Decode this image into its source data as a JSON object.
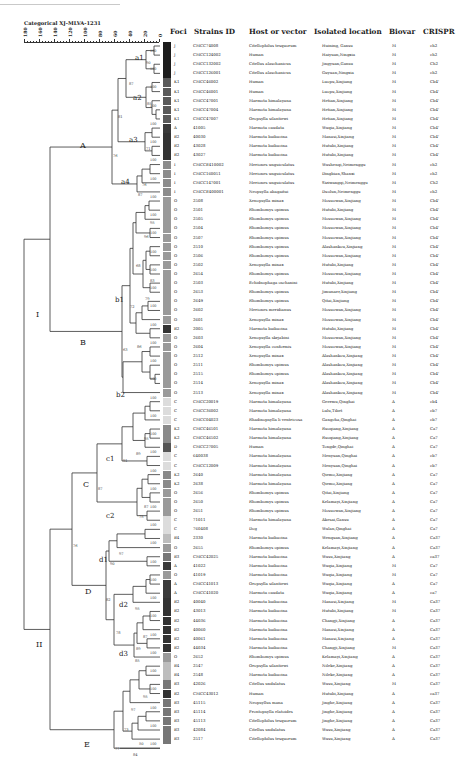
{
  "scale": {
    "title": "Categorical XJ-MLVA-1231",
    "ticks": [
      "180",
      "160",
      "140",
      "120",
      "100",
      "80",
      "60",
      "40",
      "20",
      "0"
    ]
  },
  "headers": {
    "foci": "Foci",
    "strain": "Strains ID",
    "host": "Host or vector",
    "location": "Isolated location",
    "biovar": "Biovar",
    "crispr": "CRISPR"
  },
  "foci_colors": {
    "J": "#1c1c1c",
    "K1": "#5a5a5a",
    "A": "#3a3a3a",
    "B2": "#333333",
    "I": "#8c8c8c",
    "O": "#9a9a9a",
    "C": "#dcdcdc",
    "K2": "#8a8a8a",
    "D": "#555555",
    "B4": "#bdbdbd",
    "B3": "#777777"
  },
  "clades": [
    {
      "label": "I",
      "x": 36,
      "y": 317
    },
    {
      "label": "II",
      "x": 36,
      "y": 647
    },
    {
      "label": "A",
      "x": 80,
      "y": 148
    },
    {
      "label": "B",
      "x": 80,
      "y": 345
    },
    {
      "label": "C",
      "x": 83,
      "y": 487
    },
    {
      "label": "D",
      "x": 85,
      "y": 594
    },
    {
      "label": "E",
      "x": 84,
      "y": 747
    },
    {
      "label": "a1",
      "x": 135,
      "y": 60
    },
    {
      "label": "a2",
      "x": 133,
      "y": 100
    },
    {
      "label": "a3",
      "x": 129,
      "y": 142
    },
    {
      "label": "a4",
      "x": 121,
      "y": 184
    },
    {
      "label": "b1",
      "x": 115,
      "y": 302
    },
    {
      "label": "b2",
      "x": 116,
      "y": 397
    },
    {
      "label": "c1",
      "x": 106,
      "y": 461
    },
    {
      "label": "c2",
      "x": 106,
      "y": 518
    },
    {
      "label": "d1",
      "x": 99,
      "y": 562
    },
    {
      "label": "d2",
      "x": 119,
      "y": 607
    },
    {
      "label": "d3",
      "x": 119,
      "y": 656
    }
  ],
  "bootstrap": [
    {
      "v": "90",
      "x": 146,
      "y": 64
    },
    {
      "v": "87",
      "x": 129,
      "y": 85
    },
    {
      "v": "85",
      "x": 147,
      "y": 105
    },
    {
      "v": "81",
      "x": 118,
      "y": 118
    },
    {
      "v": "71",
      "x": 146,
      "y": 150
    },
    {
      "v": "76",
      "x": 113,
      "y": 157
    },
    {
      "v": "76",
      "x": 142,
      "y": 186
    },
    {
      "v": "87",
      "x": 138,
      "y": 196
    },
    {
      "v": "95",
      "x": 150,
      "y": 224
    },
    {
      "v": "96",
      "x": 144,
      "y": 238
    },
    {
      "v": "68",
      "x": 136,
      "y": 267
    },
    {
      "v": "83",
      "x": 150,
      "y": 282
    },
    {
      "v": "79",
      "x": 145,
      "y": 300
    },
    {
      "v": "72",
      "x": 130,
      "y": 308
    },
    {
      "v": "86",
      "x": 137,
      "y": 348
    },
    {
      "v": "63",
      "x": 123,
      "y": 351
    },
    {
      "v": "95",
      "x": 144,
      "y": 440
    },
    {
      "v": "89",
      "x": 136,
      "y": 455
    },
    {
      "v": "91",
      "x": 123,
      "y": 462
    },
    {
      "v": "87",
      "x": 98,
      "y": 490
    },
    {
      "v": "87",
      "x": 144,
      "y": 508
    },
    {
      "v": "75",
      "x": 139,
      "y": 518
    },
    {
      "v": "76",
      "x": 73,
      "y": 547
    },
    {
      "v": "97",
      "x": 119,
      "y": 555
    },
    {
      "v": "90",
      "x": 110,
      "y": 565
    },
    {
      "v": "82",
      "x": 106,
      "y": 601
    },
    {
      "v": "95",
      "x": 135,
      "y": 610
    },
    {
      "v": "78",
      "x": 116,
      "y": 634
    },
    {
      "v": "87",
      "x": 143,
      "y": 638
    },
    {
      "v": "89",
      "x": 136,
      "y": 650
    },
    {
      "v": "85",
      "x": 135,
      "y": 662
    },
    {
      "v": "95",
      "x": 143,
      "y": 698
    },
    {
      "v": "97",
      "x": 131,
      "y": 711
    },
    {
      "v": "73",
      "x": 124,
      "y": 731
    },
    {
      "v": "50",
      "x": 139,
      "y": 745
    },
    {
      "v": "77",
      "x": 115,
      "y": 750
    },
    {
      "v": "84",
      "x": 133,
      "y": 756
    }
  ],
  "rows": [
    {
      "foci": "J",
      "id": "CMCC74008",
      "host": "Citellophilus tesquorum",
      "loc": "Huining, Gansu",
      "bio": "M",
      "crispr": "ch2"
    },
    {
      "foci": "J",
      "id": "CMCC124002",
      "host": "Human",
      "loc": "Haiyuan,Ningxia",
      "bio": "M",
      "crispr": "ch2"
    },
    {
      "foci": "J",
      "id": "CMCC132002",
      "host": "Citellus alaschanicus",
      "loc": "Jingyuan,Gansu",
      "bio": "M",
      "crispr": "Ch2"
    },
    {
      "foci": "J",
      "id": "CMCC126001",
      "host": "Citellus alaschanicus",
      "loc": "Guyuan,Ningxia",
      "bio": "M",
      "crispr": "ch2"
    },
    {
      "foci": "K1",
      "id": "CMCC46002",
      "host": "Human",
      "loc": "Luopu,Xinjiang",
      "bio": "M",
      "crispr": "Cb4'"
    },
    {
      "foci": "K1",
      "id": "CMCC46001",
      "host": "Human",
      "loc": "Luopu,Xinjiang",
      "bio": "M",
      "crispr": "Cb4'"
    },
    {
      "foci": "K1",
      "id": "CMCC47001",
      "host": "Marmota himalayana",
      "loc": "Hetian,Xinjiang",
      "bio": "M",
      "crispr": "Cb4'"
    },
    {
      "foci": "K1",
      "id": "CMCC47004",
      "host": "Marmota himalayana",
      "loc": "Hetian,Xinjiang",
      "bio": "M",
      "crispr": "Cb4'"
    },
    {
      "foci": "K1",
      "id": "CMCC47007",
      "host": "Oropsylla silantiewi",
      "loc": "Hetian,Xinjiang",
      "bio": "M",
      "crispr": "Cb4'"
    },
    {
      "foci": "A",
      "id": "41005",
      "host": "Marmota caudata",
      "loc": "Wuqia,Xinjiang",
      "bio": "M",
      "crispr": "Cb4'"
    },
    {
      "foci": "B2",
      "id": "40030",
      "host": "Marmota baibacina",
      "loc": "Manasi,Xinjiang",
      "bio": "M",
      "crispr": "Cb4'"
    },
    {
      "foci": "B2",
      "id": "43028",
      "host": "Marmota baibacina",
      "loc": "Hutubi,Xinjiang",
      "bio": "M",
      "crispr": "Cb4'"
    },
    {
      "foci": "B2",
      "id": "43027",
      "host": "Marmota baibacina",
      "loc": "Hutubi,Xinjiang",
      "bio": "M",
      "crispr": "Cb4'"
    },
    {
      "foci": "I",
      "id": "CMCCE410002",
      "host": "Meriones unguiculatus",
      "loc": "Wushenqi,Neimenggu",
      "bio": "M",
      "crispr": "ch2"
    },
    {
      "foci": "I",
      "id": "CMCC160051",
      "host": "Meriones unguiculatus",
      "loc": "Dingbian,Shanxi",
      "bio": "M",
      "crispr": "ch2"
    },
    {
      "foci": "I",
      "id": "CMCC147001",
      "host": "Meriones unguiculatus",
      "loc": "Siziwangqi,Neimenggu",
      "bio": "M",
      "crispr": "Ch2"
    },
    {
      "foci": "I",
      "id": "CMCCE400001",
      "host": "Neopsylla abagaitui",
      "loc": "Duolun,Neimenggu",
      "bio": "M",
      "crispr": "ch2"
    },
    {
      "foci": "O",
      "id": "2508",
      "host": "Xenopsylla minax",
      "loc": "Mosuowan,Xinjiang",
      "bio": "M",
      "crispr": "Cb4'"
    },
    {
      "foci": "O",
      "id": "2501",
      "host": "Rhombomys opimus",
      "loc": "Hutubi,Xinjiang",
      "bio": "M",
      "crispr": "Cb4'"
    },
    {
      "foci": "O",
      "id": "2505",
      "host": "Rhombomys opimus",
      "loc": "Mosuowan,Xinjiang",
      "bio": "M",
      "crispr": "Cb4'"
    },
    {
      "foci": "O",
      "id": "2504",
      "host": "Rhombomys opimus",
      "loc": "Mosuowan,Xinjiang",
      "bio": "M",
      "crispr": "Cb4'"
    },
    {
      "foci": "O",
      "id": "2507",
      "host": "Rhombomys opimus",
      "loc": "Mosuowan,Xinjiang",
      "bio": "M",
      "crispr": "Cb4'"
    },
    {
      "foci": "O",
      "id": "2510",
      "host": "Rhombomys opimus",
      "loc": "Alashankou,Xinjiang",
      "bio": "M",
      "crispr": "Cb4'"
    },
    {
      "foci": "O",
      "id": "2506",
      "host": "Rhombomys opimus",
      "loc": "Mosuowan,Xinjiang",
      "bio": "M",
      "crispr": "Cb4'"
    },
    {
      "foci": "O",
      "id": "2502",
      "host": "Xenopsylla minax",
      "loc": "Hutubi,Xinjiang",
      "bio": "M",
      "crispr": "Cb4'"
    },
    {
      "foci": "O",
      "id": "2654",
      "host": "Rhombomys opimus",
      "loc": "Mosuowan,Xinjiang",
      "bio": "M",
      "crispr": "Cb4'"
    },
    {
      "foci": "O",
      "id": "2503",
      "host": "Echidnophaga oschanini",
      "loc": "Hutubi,Xinjiang",
      "bio": "M",
      "crispr": "Cb4'"
    },
    {
      "foci": "O",
      "id": "2653",
      "host": "Rhombomys opimus",
      "loc": "Jimunaer,Xinjiang",
      "bio": "M",
      "crispr": "Cb4'"
    },
    {
      "foci": "O",
      "id": "2649",
      "host": "Rhombomys opimus",
      "loc": "Qitai,Xinjiang",
      "bio": "M",
      "crispr": "Cb4'"
    },
    {
      "foci": "O",
      "id": "2602",
      "host": "Meriones meridianus",
      "loc": "Mosuowan,Xinjiang",
      "bio": "M",
      "crispr": "Cb4'"
    },
    {
      "foci": "O",
      "id": "2601",
      "host": "Xenopsylla minax",
      "loc": "Mosuowan,Xinjiang",
      "bio": "M",
      "crispr": "Cb4'"
    },
    {
      "foci": "B2",
      "id": "2005",
      "host": "Marmota baibacina",
      "loc": "Hutubi,Xinjiang",
      "bio": "M",
      "crispr": "Cb4'"
    },
    {
      "foci": "O",
      "id": "2603",
      "host": "Xenopsylla skrjabini",
      "loc": "Mosuowan,Xinjiang",
      "bio": "M",
      "crispr": "Cb4'"
    },
    {
      "foci": "O",
      "id": "2604",
      "host": "Xenopsylla conformis",
      "loc": "Mosuowan,Xinjiang",
      "bio": "M",
      "crispr": "Cb4'"
    },
    {
      "foci": "O",
      "id": "2512",
      "host": "Xenopsylla minax",
      "loc": "Alashankou,Xinjiang",
      "bio": "M",
      "crispr": "Cb4'"
    },
    {
      "foci": "O",
      "id": "2511",
      "host": "Rhombomys opimus",
      "loc": "Alashankou,Xinjiang",
      "bio": "M",
      "crispr": "Cb4'"
    },
    {
      "foci": "O",
      "id": "2515",
      "host": "Rhombomys opimus",
      "loc": "Alashankou,Xinjiang",
      "bio": "M",
      "crispr": "Cb4'"
    },
    {
      "foci": "O",
      "id": "2514",
      "host": "Xenopsylla minax",
      "loc": "Alashankou,Xinjiang",
      "bio": "M",
      "crispr": "Cb4'"
    },
    {
      "foci": "O",
      "id": "2513",
      "host": "Xenopsylla minax",
      "loc": "Alashankou,Xinjiang",
      "bio": "M",
      "crispr": "Cb4'"
    },
    {
      "foci": "C",
      "id": "CMCC20019",
      "host": "Marmota himalayana",
      "loc": "Geermu,Qinghai",
      "bio": "A",
      "crispr": "cb4"
    },
    {
      "foci": "C",
      "id": "CMCC36002",
      "host": "Marmota himalayana",
      "loc": "Lulu,Tibet",
      "bio": "A",
      "crispr": "cb7"
    },
    {
      "foci": "C",
      "id": "CMCC04023",
      "host": "Rhadinopsylla li ventricosa",
      "loc": "Gangcha,Qinghai",
      "bio": "A",
      "crispr": "cb7"
    },
    {
      "foci": "K2",
      "id": "CMCC46501",
      "host": "Marmota himalayana",
      "loc": "Ruoqiang,Xinjiang",
      "bio": "A",
      "crispr": "Ca7"
    },
    {
      "foci": "K2",
      "id": "CMCC46502",
      "host": "Marmota himalayana",
      "loc": "Ruoqiang,Xinjiang",
      "bio": "A",
      "crispr": "Ca7"
    },
    {
      "foci": "D",
      "id": "CMCC27005",
      "host": "Human",
      "loc": "Tongde,Qinghai",
      "bio": "A",
      "crispr": "Ca7"
    },
    {
      "foci": "C",
      "id": "640038",
      "host": "Marmota himalayana",
      "loc": "Menyuan,Qinghai",
      "bio": "A",
      "crispr": "cb7"
    },
    {
      "foci": "C",
      "id": "CMCC12009",
      "host": "Marmota himalayana",
      "loc": "Menyuan,Qinghai",
      "bio": "A",
      "crispr": "cb7"
    },
    {
      "foci": "K2",
      "id": "2640",
      "host": "Marmota himalayana",
      "loc": "Qiemo,Xinjiang",
      "bio": "A",
      "crispr": "Ca7"
    },
    {
      "foci": "K2",
      "id": "2638",
      "host": "Marmota himalayana",
      "loc": "Qiemo,Xinjiang",
      "bio": "A",
      "crispr": "Ca7"
    },
    {
      "foci": "O",
      "id": "2656",
      "host": "Rhombomys opimus",
      "loc": "Qitai,Xinjiang",
      "bio": "A",
      "crispr": "Ca7"
    },
    {
      "foci": "O",
      "id": "2650",
      "host": "Rhombomys opimus",
      "loc": "Kelamayi,Xinjiang",
      "bio": "A",
      "crispr": "Ca7"
    },
    {
      "foci": "O",
      "id": "2651",
      "host": "Rhombomys opimus",
      "loc": "Mosuowan,Xinjiang",
      "bio": "A",
      "crispr": "Ca7"
    },
    {
      "foci": "C",
      "id": "71011",
      "host": "Marmota himalayana",
      "loc": "Akesai,Gansu",
      "bio": "A",
      "crispr": "Ca7"
    },
    {
      "foci": "C",
      "id": "760408",
      "host": "Dog",
      "loc": "Wulan,Qinghai",
      "bio": "A",
      "crispr": "Ca7"
    },
    {
      "foci": "B4",
      "id": "2330",
      "host": "Marmota baibacina",
      "loc": "Wenquan,Xinjiang",
      "bio": "A",
      "crispr": "Ca37"
    },
    {
      "foci": "O",
      "id": "2655",
      "host": "Rhombomys opimus",
      "loc": "Kelamayi,Xinjiang",
      "bio": "A",
      "crispr": "Ca37"
    },
    {
      "foci": "B3",
      "id": "CMCC42025",
      "host": "Marmota baibacina",
      "loc": "Wusu,Xinjiang",
      "bio": "A",
      "crispr": "ca37"
    },
    {
      "foci": "A",
      "id": "41022",
      "host": "Marmota baibacina",
      "loc": "Wuqia,Xinjiang",
      "bio": "M",
      "crispr": "Ca7"
    },
    {
      "foci": "O",
      "id": "41019",
      "host": "Marmota baibacina",
      "loc": "Wuqia,Xinjiang",
      "bio": "M",
      "crispr": "Ca7"
    },
    {
      "foci": "A",
      "id": "CMCC41013",
      "host": "Oropsylla silantiewi",
      "loc": "Wuqia,Xinjiang",
      "bio": "A",
      "crispr": "Ca7"
    },
    {
      "foci": "A",
      "id": "CMCC41020",
      "host": "Marmota caudata",
      "loc": "Wuqia,Xinjiang",
      "bio": "A",
      "crispr": "ca7"
    },
    {
      "foci": "B2",
      "id": "40040",
      "host": "Marmota baibacina",
      "loc": "Manasi,Xinjiang",
      "bio": "M",
      "crispr": "Ca37"
    },
    {
      "foci": "B2",
      "id": "43013",
      "host": "Marmota baibacina",
      "loc": "Hutubi,Xinjiang",
      "bio": "M",
      "crispr": "Ca37"
    },
    {
      "foci": "B2",
      "id": "44036",
      "host": "Marmota baibacina",
      "loc": "Changji,Xinjiang",
      "bio": "A",
      "crispr": "Ca37"
    },
    {
      "foci": "B2",
      "id": "40060",
      "host": "Marmota baibacina",
      "loc": "Manasi,Xinjiang",
      "bio": "A",
      "crispr": "Ca37"
    },
    {
      "foci": "B2",
      "id": "40061",
      "host": "Marmota baibacina",
      "loc": "Manasi,Xinjiang",
      "bio": "A",
      "crispr": "Ca37"
    },
    {
      "foci": "B2",
      "id": "44034",
      "host": "Marmota baibacina",
      "loc": "Changji,Xinjiang",
      "bio": "M",
      "crispr": "Ca37"
    },
    {
      "foci": "O",
      "id": "2652",
      "host": "Rhombomys opimus",
      "loc": "Kelamayi,Xinjiang",
      "bio": "A",
      "crispr": "Ca37"
    },
    {
      "foci": "B4",
      "id": "2547",
      "host": "Oropsylla silantiewi",
      "loc": "Nileke,Xinjiang",
      "bio": "A",
      "crispr": "Ca37"
    },
    {
      "foci": "B4",
      "id": "2548",
      "host": "Marmota baibacina",
      "loc": "Nileke,Xinjiang",
      "bio": "A",
      "crispr": "Ca37"
    },
    {
      "foci": "B3",
      "id": "42026",
      "host": "Citellus undulatus",
      "loc": "Wusu,Xinjiang",
      "bio": "M",
      "crispr": "Ca37"
    },
    {
      "foci": "B2",
      "id": "CMCC43012",
      "host": "Human",
      "loc": "Hutubi,Xinjiang",
      "bio": "A",
      "crispr": "ca37"
    },
    {
      "foci": "B3",
      "id": "45115",
      "host": "Neopsyllus mana",
      "loc": "Jinghe,Xinjiang",
      "bio": "A",
      "crispr": "Ca37"
    },
    {
      "foci": "B3",
      "id": "45114",
      "host": "Frontopsylla elatoides",
      "loc": "Jinghe,Xinjiang",
      "bio": "A",
      "crispr": "Ca37"
    },
    {
      "foci": "B3",
      "id": "45113",
      "host": "Citellophilus tesquorum",
      "loc": "Jinghe,Xinjiang",
      "bio": "A",
      "crispr": "Ca37"
    },
    {
      "foci": "B3",
      "id": "42084",
      "host": "Citellus undulatus",
      "loc": "Wusu,Xinjiang",
      "bio": "A",
      "crispr": "Ca37"
    },
    {
      "foci": "B3",
      "id": "2517",
      "host": "Citellophilus tesquorum",
      "loc": "Wusu,Xinjiang",
      "bio": "A",
      "crispr": "Ca37"
    }
  ]
}
